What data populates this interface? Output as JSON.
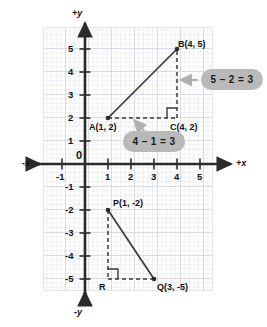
{
  "diagram": {
    "axes": {
      "x_positive_label": "+x",
      "x_negative_label": "-x",
      "y_positive_label": "+y",
      "y_negative_label": "-y",
      "origin_label": "0",
      "x_ticks": [
        "-1",
        "1",
        "2",
        "3",
        "4",
        "5"
      ],
      "y_ticks": [
        "5",
        "4",
        "3",
        "2",
        "1",
        "-1",
        "-2",
        "-3",
        "-4",
        "-5"
      ],
      "x_range": [
        -1.8,
        6.4
      ],
      "y_range": [
        -5.9,
        5.9
      ],
      "grid": true
    },
    "points": [
      {
        "id": "A",
        "label": "A(1, 2)",
        "x": 1,
        "y": 2
      },
      {
        "id": "B",
        "label": "B(4, 5)",
        "x": 4,
        "y": 5
      },
      {
        "id": "C",
        "label": "C(4, 2)",
        "x": 4,
        "y": 2
      },
      {
        "id": "P",
        "label": "P(1, -2)",
        "x": 1,
        "y": -2
      },
      {
        "id": "Q",
        "label": "Q(3, -5)",
        "x": 3,
        "y": -5
      },
      {
        "id": "R",
        "label": "R",
        "x": 1,
        "y": -5
      }
    ],
    "segments": [
      {
        "from": "A",
        "to": "B",
        "style": "solid",
        "name": "hypotenuse-ab"
      },
      {
        "from": "A",
        "to": "C",
        "style": "dashed",
        "name": "leg-ac"
      },
      {
        "from": "B",
        "to": "C",
        "style": "dashed",
        "name": "leg-bc"
      },
      {
        "from": "P",
        "to": "Q",
        "style": "solid",
        "name": "hypotenuse-pq"
      },
      {
        "from": "P",
        "to": "R",
        "style": "dashed",
        "name": "leg-pr"
      },
      {
        "from": "R",
        "to": "Q",
        "style": "dashed",
        "name": "leg-rq"
      }
    ],
    "right_angles": [
      {
        "at": "C",
        "name": "right-angle-marker-c"
      },
      {
        "at": "R",
        "name": "right-angle-marker-r"
      }
    ],
    "callouts": [
      {
        "id": "vertical",
        "text": "5 – 2 = 3",
        "describes": "leg-bc"
      },
      {
        "id": "horizontal",
        "text": "4 – 1 = 3",
        "describes": "leg-ac"
      }
    ],
    "colors": {
      "pill_background": "#b9b9b9",
      "pill_text": "#1b1b1b",
      "axis": "#2b2b2b",
      "grid_major": "#d9dde3",
      "grid_minor": "#edeff2",
      "segment": "#3a3a3a",
      "arrow": "#b0b0b0"
    }
  }
}
